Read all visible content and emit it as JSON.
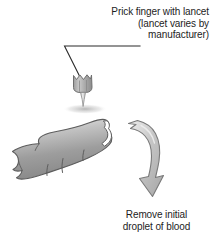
{
  "figure": {
    "background_color": "#ffffff",
    "text_color": "#1d1d1d",
    "line_color": "#2b2b2b"
  },
  "callouts": {
    "top": {
      "line1": "Prick finger with lancet",
      "line2": "(lancet varies by",
      "line3": "manufacturer)",
      "full_text": "Prick finger with lancet (lancet varies by manufacturer)"
    },
    "bottom": {
      "line1": "Remove initial",
      "line2": "droplet of blood",
      "full_text": "Remove initial droplet of blood"
    }
  },
  "illustration": {
    "leader_line": "leader-line",
    "lancet": {
      "label": "lancet",
      "body_color": "#a8a8a8",
      "highlight_color": "#dcdcdc",
      "outline_color": "#6f6f6f"
    },
    "finger": {
      "label": "finger",
      "fill_light": "#dedede",
      "fill_mid": "#9c9c9c",
      "fill_dark": "#7d7d7d",
      "outline_color": "#5d5d5d",
      "nail_color": "#ffffff"
    },
    "arrow": {
      "label": "curved-arrow",
      "fill_light": "#e6e6e6",
      "fill_mid": "#b5b5b5",
      "outline_color": "#7a7a7a"
    },
    "shadow_color": "#b9b9b9"
  }
}
